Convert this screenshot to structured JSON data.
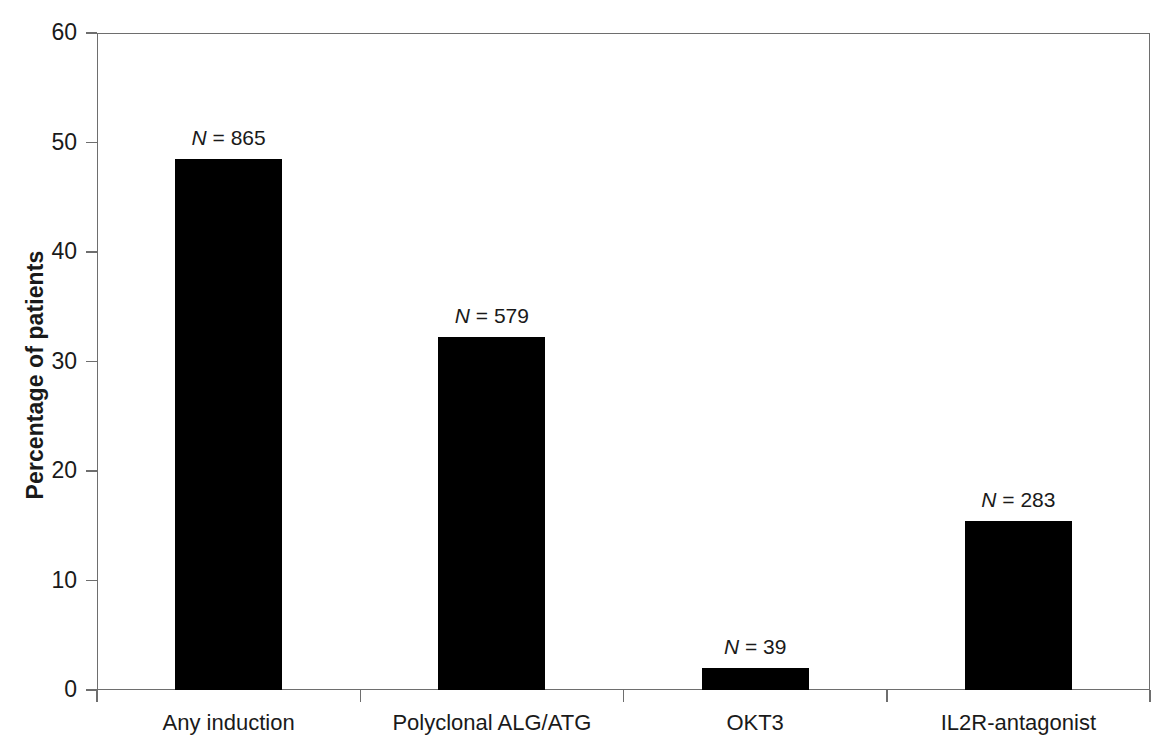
{
  "chart_data": {
    "type": "bar",
    "title": "",
    "xlabel": "",
    "ylabel": "Percentage of patients",
    "ylim": [
      0,
      60
    ],
    "yticks": [
      0,
      10,
      20,
      30,
      40,
      50,
      60
    ],
    "ytick_labels": [
      "0",
      "10",
      "20",
      "30",
      "40",
      "50",
      "60"
    ],
    "grid": false,
    "legend": null,
    "bar_color": "#000000",
    "axis_color": "#6e6e6e",
    "categories": [
      "Any induction",
      "Polyclonal ALG/ATG",
      "OKT3",
      "IL2R-antagonist"
    ],
    "values": [
      48.5,
      32.2,
      2.0,
      15.4
    ],
    "annotations": [
      "N = 865",
      "N = 579",
      "N = 39",
      "N = 283"
    ],
    "annotation_parts": [
      {
        "symbol": "N",
        "rest": " = 865"
      },
      {
        "symbol": "N",
        "rest": " = 579"
      },
      {
        "symbol": "N",
        "rest": " = 39"
      },
      {
        "symbol": "N",
        "rest": " = 283"
      }
    ],
    "n_values": [
      865,
      579,
      39,
      283
    ]
  }
}
